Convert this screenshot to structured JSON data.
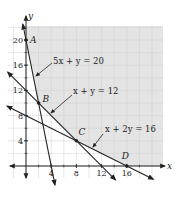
{
  "figure": {
    "type": "linear-programming-feasible-region",
    "axes": {
      "x_label": "x",
      "y_label": "y",
      "x_ticks": [
        4,
        8,
        12,
        16
      ],
      "y_ticks": [
        4,
        8,
        12,
        16,
        20
      ],
      "x_range": [
        -3,
        21
      ],
      "y_range": [
        -3,
        23
      ],
      "grid_step": 2
    },
    "lines": [
      {
        "label": "5x + y = 20",
        "a": 5,
        "b": 1,
        "c": 20
      },
      {
        "label": "x + y = 12",
        "a": 1,
        "b": 1,
        "c": 12
      },
      {
        "label": "x + 2y = 16",
        "a": 1,
        "b": 2,
        "c": 16
      }
    ],
    "points": [
      {
        "label": "A",
        "x": 0,
        "y": 20
      },
      {
        "label": "B",
        "x": 2,
        "y": 10
      },
      {
        "label": "C",
        "x": 8,
        "y": 4
      },
      {
        "label": "D",
        "x": 16,
        "y": 0
      }
    ],
    "shaded_region": "feasible region above all three lines",
    "colors": {
      "shade": "#e4e4e4",
      "grid": "#cfcfcf",
      "line": "#222222"
    }
  }
}
